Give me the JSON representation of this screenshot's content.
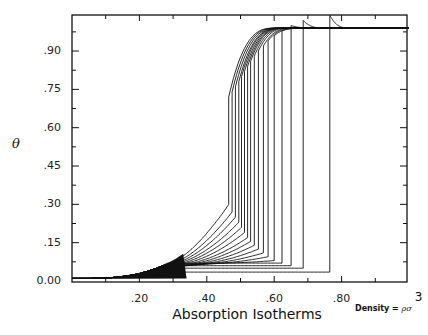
{
  "chart_data": {
    "type": "line",
    "title": "",
    "xlabel": "Absorption Isotherms",
    "xlabel_note": "Density = ρσ",
    "xlabel_note_superscript": "3",
    "ylabel": "θ",
    "xlim": [
      0.0,
      1.0
    ],
    "ylim": [
      0.0,
      1.0
    ],
    "x_ticks": [
      0.2,
      0.4,
      0.6,
      0.8
    ],
    "x_tick_labels": [
      ".20",
      ".40",
      ".60",
      ".80"
    ],
    "y_ticks": [
      0.0,
      0.15,
      0.3,
      0.45,
      0.6,
      0.75,
      0.9
    ],
    "y_tick_labels": [
      "0.00",
      ".15",
      ".30",
      ".45",
      ".60",
      ".75",
      ".90"
    ],
    "grid": false,
    "legend": null,
    "plateau_theta": 0.99,
    "series_count": 17,
    "jump_densities": [
      0.465,
      0.475,
      0.485,
      0.495,
      0.503,
      0.512,
      0.521,
      0.53,
      0.541,
      0.553,
      0.568,
      0.582,
      0.6,
      0.623,
      0.65,
      0.686,
      0.765
    ],
    "low_branch_theta_at_jump": [
      0.3,
      0.27,
      0.25,
      0.23,
      0.21,
      0.19,
      0.17,
      0.155,
      0.14,
      0.125,
      0.11,
      0.095,
      0.08,
      0.07,
      0.06,
      0.05,
      0.035
    ]
  },
  "labels": {
    "ylabel": "θ",
    "xtitle": "Absorption Isotherms",
    "density_prefix": "Density = ",
    "density_rho": "ρ",
    "density_sigma": "σ",
    "density_exp": "3"
  }
}
